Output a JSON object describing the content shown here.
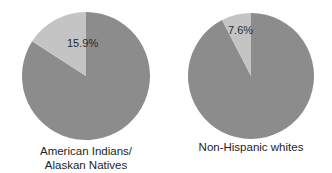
{
  "chart_data": [
    {
      "type": "pie",
      "title": "",
      "slices": [
        {
          "label": "highlighted",
          "value": 15.9,
          "color": "#c4c4c4"
        },
        {
          "label": "remainder",
          "value": 84.1,
          "color": "#8c8c8c"
        }
      ],
      "data_label": "15.9%",
      "caption_lines": [
        "American Indians/",
        "Alaskan Natives"
      ]
    },
    {
      "type": "pie",
      "title": "",
      "slices": [
        {
          "label": "highlighted",
          "value": 7.6,
          "color": "#c4c4c4"
        },
        {
          "label": "remainder",
          "value": 92.4,
          "color": "#8c8c8c"
        }
      ],
      "data_label": "7.6%",
      "caption_lines": [
        "Non-Hispanic whites"
      ]
    }
  ]
}
